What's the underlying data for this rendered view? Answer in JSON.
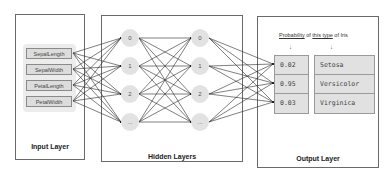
{
  "diagram": {
    "input_layer": {
      "label": "Input Layer",
      "features": [
        "SepalLength",
        "SepalWidth",
        "PetalLength",
        "PetalWidth"
      ]
    },
    "hidden_layers": {
      "label": "Hidden Layers",
      "columns": [
        {
          "nodes": [
            "0",
            "1",
            "2",
            "..."
          ]
        },
        {
          "nodes": [
            "0",
            "1",
            "2",
            "..."
          ]
        }
      ]
    },
    "output_layer": {
      "label": "Output Layer",
      "caption": {
        "part1": "Probability",
        "part2": " of ",
        "part3": "this type",
        "part4": " of Iris"
      },
      "arrow_glyph": "↓",
      "rows": [
        {
          "probability": "0.02",
          "class": "Setosa"
        },
        {
          "probability": "0.95",
          "class": "Versicolor"
        },
        {
          "probability": "0.03",
          "class": "Virginica"
        }
      ]
    },
    "colors": {
      "border": "#6a6a6a",
      "node_fill": "#e2e2e2",
      "cell_fill": "#e1e1e1",
      "edge": "#2a2a2a"
    }
  }
}
